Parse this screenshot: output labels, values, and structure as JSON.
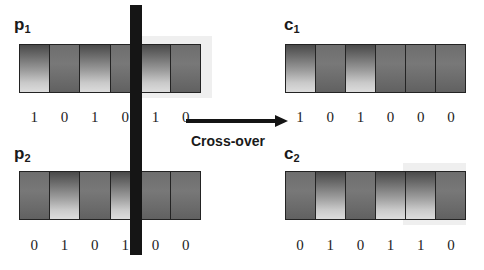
{
  "diagram": {
    "title": "Cross-over",
    "operator_label": "Cross-over",
    "arrow_icon": "right-arrow-icon",
    "cut_marker": "crossover-cut-bar"
  },
  "chromosomes": [
    {
      "id": "p1",
      "label": "p",
      "subscript": "1",
      "role": "parent",
      "bits": [
        "1",
        "0",
        "1",
        "0",
        "1",
        "0"
      ],
      "cells": [
        1,
        0,
        1,
        0,
        1,
        0
      ]
    },
    {
      "id": "p2",
      "label": "p",
      "subscript": "2",
      "role": "parent",
      "bits": [
        "0",
        "1",
        "0",
        "1",
        "0",
        "0"
      ],
      "cells": [
        0,
        1,
        0,
        1,
        0,
        0
      ]
    },
    {
      "id": "c1",
      "label": "c",
      "subscript": "1",
      "role": "child",
      "bits": [
        "1",
        "0",
        "1",
        "0",
        "0",
        "0"
      ],
      "cells": [
        1,
        0,
        1,
        0,
        0,
        0
      ]
    },
    {
      "id": "c2",
      "label": "c",
      "subscript": "2",
      "role": "child",
      "bits": [
        "0",
        "1",
        "0",
        "1",
        "1",
        "0"
      ],
      "cells": [
        0,
        1,
        0,
        1,
        1,
        0
      ]
    }
  ],
  "colors": {
    "ink": "#1a1a1a",
    "cut_bar": "#151515",
    "cell_border": "#232323",
    "cell_off": "#6f6f6f",
    "halo": "#efefef"
  }
}
